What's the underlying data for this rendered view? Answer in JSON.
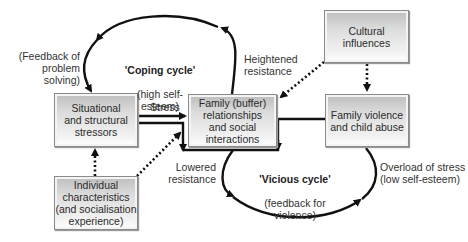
{
  "boxes": {
    "situational": "Situational\nand structural\nstressors",
    "family_buffer": "Family (buffer)\nrelationships\nand social\ninteractions",
    "cultural": "Cultural\ninfluences",
    "family_violence": "Family violence\nand child abuse",
    "individual": "Individual\ncharacteristics\n(and socialisation\nexperience)"
  },
  "labels": {
    "feedback_problem_solving": "(Feedback of\nproblem solving)",
    "coping_title": "'Coping cycle'",
    "coping_sub": "(high self-esteem)",
    "heightened_resistance": "Heightened\nresistance",
    "stress": "Stress",
    "lowered_resistance": "Lowered\nresistance",
    "vicious_title": "'Vicious cycle'",
    "vicious_sub": "(feedback for violence)",
    "overload": "Overload of stress\n(low self-esteem)"
  }
}
